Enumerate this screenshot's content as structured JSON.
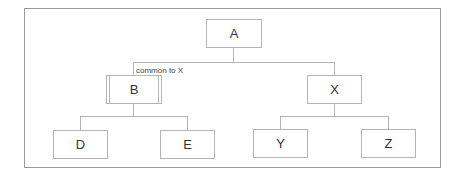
{
  "diagram": {
    "type": "tree",
    "root": {
      "id": "A",
      "label": "A",
      "children": [
        {
          "id": "B",
          "label": "B",
          "style": "double-sided",
          "annotation": "common to X",
          "children": [
            {
              "id": "D",
              "label": "D"
            },
            {
              "id": "E",
              "label": "E"
            }
          ]
        },
        {
          "id": "X",
          "label": "X",
          "children": [
            {
              "id": "Y",
              "label": "Y"
            },
            {
              "id": "Z",
              "label": "Z"
            }
          ]
        }
      ]
    },
    "nodes": {
      "A": {
        "label": "A"
      },
      "B": {
        "label": "B"
      },
      "X": {
        "label": "X"
      },
      "D": {
        "label": "D"
      },
      "E": {
        "label": "E"
      },
      "Y": {
        "label": "Y"
      },
      "Z": {
        "label": "Z"
      }
    },
    "edges": [
      [
        "A",
        "B"
      ],
      [
        "A",
        "X"
      ],
      [
        "B",
        "D"
      ],
      [
        "B",
        "E"
      ],
      [
        "X",
        "Y"
      ],
      [
        "X",
        "Z"
      ]
    ],
    "annotation": "common to X",
    "colors": {
      "border": "#b4b4b4",
      "frame": "#9a9a9a",
      "text": "#333333"
    }
  }
}
